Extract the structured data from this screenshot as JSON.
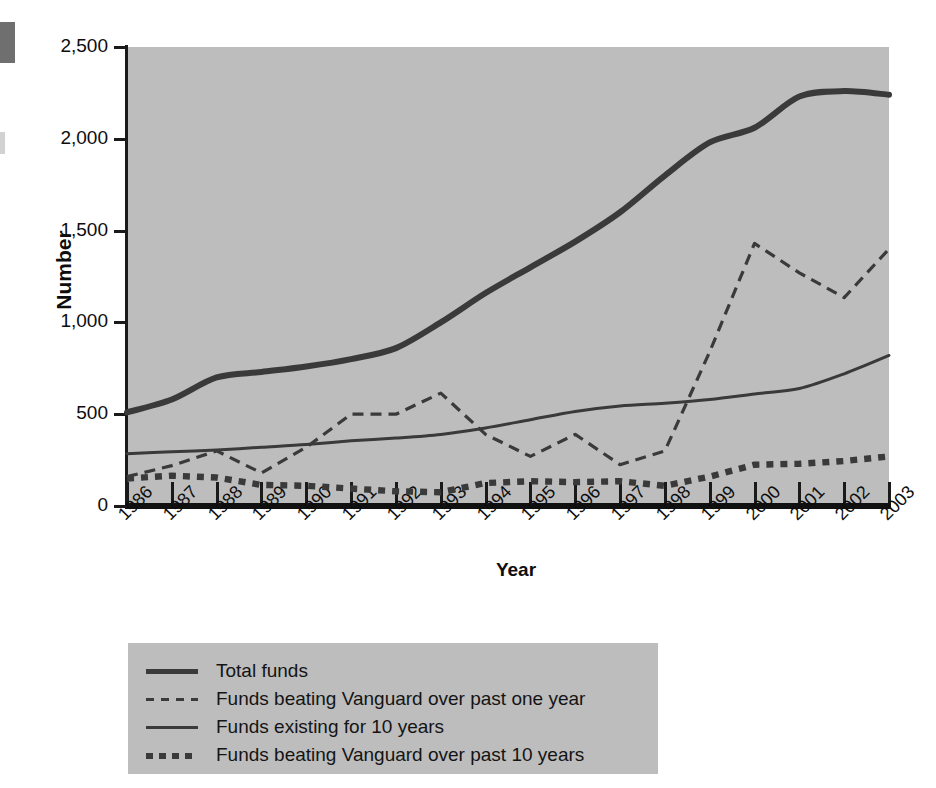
{
  "axes": {
    "y_title": "Number",
    "x_title": "Year",
    "y_ticks": [
      "0",
      "500",
      "1,000",
      "1,500",
      "2,000",
      "2,500"
    ],
    "x_ticks": [
      "1986",
      "1987",
      "1988",
      "1989",
      "1990",
      "1991",
      "1992",
      "1993",
      "1994",
      "1995",
      "1996",
      "1997",
      "1998",
      "1999",
      "2000",
      "2001",
      "2002",
      "2003"
    ]
  },
  "legend": {
    "items": [
      {
        "label": "Total funds",
        "style": "thick-solid"
      },
      {
        "label": "Funds beating Vanguard over past one year",
        "style": "thin-dashed"
      },
      {
        "label": "Funds existing for 10 years",
        "style": "thin-solid"
      },
      {
        "label": "Funds beating Vanguard over past 10 years",
        "style": "thick-dotted"
      }
    ]
  },
  "colors": {
    "plot_background": "#bdbdbd",
    "line": "#3a3a3a",
    "axis": "#1a1a1a",
    "page_background": "#ffffff"
  },
  "chart_data": {
    "type": "line",
    "title": "",
    "xlabel": "Year",
    "ylabel": "Number",
    "ylim": [
      0,
      2500
    ],
    "grid": false,
    "legend_position": "below-left",
    "x": [
      1986,
      1987,
      1988,
      1989,
      1990,
      1991,
      1992,
      1993,
      1994,
      1995,
      1996,
      1997,
      1998,
      1999,
      2000,
      2001,
      2002,
      2003
    ],
    "series": [
      {
        "name": "Total funds",
        "style": "thick-solid",
        "values": [
          510,
          580,
          700,
          730,
          760,
          800,
          860,
          1000,
          1160,
          1300,
          1440,
          1600,
          1800,
          1980,
          2060,
          2230,
          2260,
          2240
        ]
      },
      {
        "name": "Funds beating Vanguard over past one year",
        "style": "thin-dashed",
        "values": [
          160,
          220,
          300,
          180,
          320,
          500,
          500,
          615,
          390,
          270,
          390,
          225,
          300,
          840,
          1430,
          1270,
          1135,
          1400
        ]
      },
      {
        "name": "Funds existing for 10 years",
        "style": "thin-solid",
        "values": [
          285,
          295,
          305,
          320,
          335,
          355,
          370,
          390,
          425,
          470,
          515,
          545,
          560,
          580,
          610,
          640,
          720,
          820
        ]
      },
      {
        "name": "Funds beating Vanguard over past 10 years",
        "style": "thick-dotted",
        "values": [
          150,
          165,
          155,
          115,
          110,
          95,
          80,
          75,
          125,
          135,
          130,
          135,
          110,
          160,
          225,
          230,
          245,
          270
        ]
      }
    ]
  }
}
